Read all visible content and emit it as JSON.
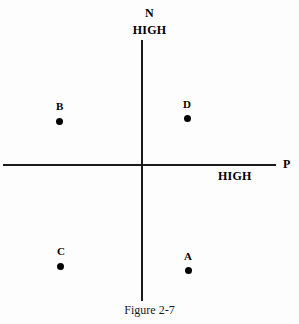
{
  "figure": {
    "caption": "Figure 2-7",
    "axes": {
      "vertical": {
        "name": "N",
        "high_label": "HIGH"
      },
      "horizontal": {
        "name": "P",
        "high_label": "HIGH"
      }
    },
    "points": [
      {
        "label": "B",
        "x": 59,
        "y": 121,
        "label_x": 56,
        "label_y": 101,
        "quadrant": "upper-left"
      },
      {
        "label": "D",
        "x": 187,
        "y": 118,
        "label_x": 183,
        "label_y": 99,
        "quadrant": "upper-right"
      },
      {
        "label": "C",
        "x": 60,
        "y": 266,
        "label_x": 57,
        "label_y": 246,
        "quadrant": "lower-left"
      },
      {
        "label": "A",
        "x": 188,
        "y": 270,
        "label_x": 184,
        "label_y": 251,
        "quadrant": "lower-right"
      }
    ],
    "colors": {
      "axis": "#1a1a1a",
      "point": "#000000",
      "text": "#000000",
      "background": "#fdfdfd"
    }
  }
}
